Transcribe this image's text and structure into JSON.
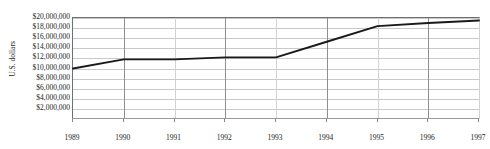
{
  "chart_data": {
    "type": "line",
    "title": "",
    "xlabel": "",
    "ylabel": "U.S. dollars",
    "x": [
      1989,
      1990,
      1991,
      1992,
      1993,
      1994,
      1995,
      1996,
      1997
    ],
    "x_tick_labels": [
      "1989",
      "1990",
      "1991",
      "1992",
      "1993",
      "1994",
      "1995",
      "1996",
      "1997"
    ],
    "y_tick_labels": [
      "$20,000,000",
      "$18,000,000",
      "$16,000,000",
      "$14,000,000",
      "$12,000,000",
      "$10,000,000",
      "$8,000,000",
      "$6,000,000",
      "$4,000,000",
      "$2,000,000"
    ],
    "y_ticks": [
      20000000,
      18000000,
      16000000,
      14000000,
      12000000,
      10000000,
      8000000,
      6000000,
      4000000,
      2000000
    ],
    "ylim": [
      0,
      20000000
    ],
    "xlim": [
      1989,
      1997
    ],
    "grid": true,
    "legend": "none",
    "series": [
      {
        "name": "U.S. dollars",
        "color": "#1a1a1a",
        "values": [
          10000000,
          11800000,
          11800000,
          12200000,
          12200000,
          15300000,
          18400000,
          19000000,
          19500000
        ]
      }
    ]
  }
}
